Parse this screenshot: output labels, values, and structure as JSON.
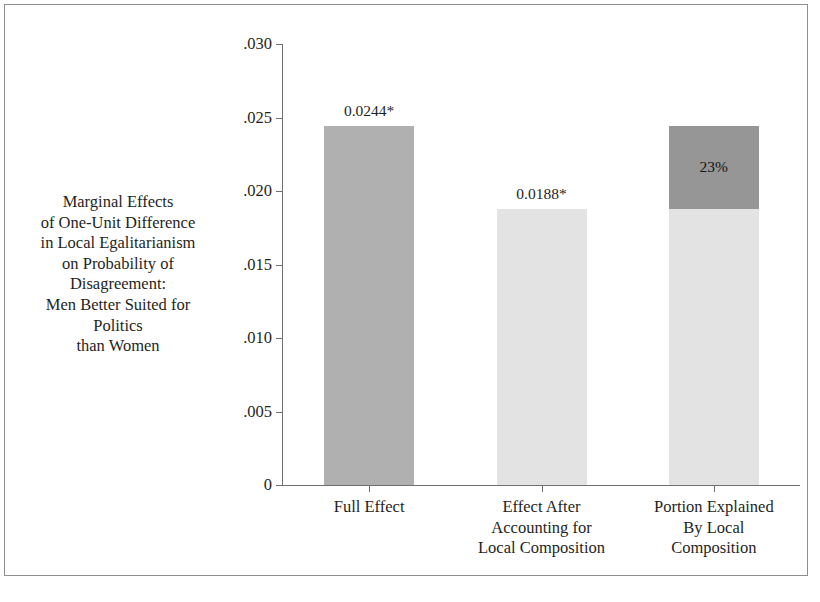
{
  "chart_data": {
    "type": "bar",
    "title": "",
    "subtitle": "",
    "xlabel": "",
    "ylabel": "Marginal Effects of One-Unit Difference in Local Egalitarianism on Probability of Disagreement: Men Better Suited for Politics than Women",
    "ylabel_lines": [
      "Marginal Effects",
      "of One-Unit Difference",
      "in Local Egalitarianism",
      "on Probability of",
      "Disagreement:",
      "Men Better Suited for",
      "Politics",
      "than Women"
    ],
    "ylim": [
      0,
      0.03
    ],
    "yticks": [
      0,
      0.005,
      0.01,
      0.015,
      0.02,
      0.025,
      0.03
    ],
    "ytick_labels": [
      "0",
      ".005",
      ".010",
      ".015",
      ".020",
      ".025",
      ".030"
    ],
    "grid": false,
    "legend": "none",
    "categories": [
      "Full Effect",
      "Effect After Accounting for Local Composition",
      "Portion Explained By Local Composition"
    ],
    "category_label_lines": [
      [
        "Full Effect"
      ],
      [
        "Effect After",
        "Accounting for",
        "Local Composition"
      ],
      [
        "Portion Explained",
        "By Local",
        "Composition"
      ]
    ],
    "values": [
      0.0244,
      0.0188,
      0.0244
    ],
    "bars": [
      {
        "category": "Full Effect",
        "value": 0.0244,
        "value_label": "0.0244*",
        "significant": true,
        "stacked": false,
        "color": "#b0b0b0",
        "segments": [
          {
            "name": "full-effect",
            "from": 0,
            "to": 0.0244,
            "color": "#b0b0b0",
            "label": ""
          }
        ]
      },
      {
        "category": "Effect After Accounting for Local Composition",
        "value": 0.0188,
        "value_label": "0.0188*",
        "significant": true,
        "stacked": false,
        "color": "#e3e3e3",
        "segments": [
          {
            "name": "residual-effect",
            "from": 0,
            "to": 0.0188,
            "color": "#e3e3e3",
            "label": ""
          }
        ]
      },
      {
        "category": "Portion Explained By Local Composition",
        "value": 0.0244,
        "value_label": "",
        "significant": false,
        "stacked": true,
        "color": "#969696",
        "segments": [
          {
            "name": "unexplained-portion",
            "from": 0,
            "to": 0.0188,
            "color": "#e3e3e3",
            "label": ""
          },
          {
            "name": "explained-portion",
            "from": 0.0188,
            "to": 0.0244,
            "color": "#969696",
            "label": "23%"
          }
        ]
      }
    ],
    "annotations": [
      {
        "name": "bar-1-value",
        "text": "0.0244*",
        "at_value": 0.0244
      },
      {
        "name": "bar-2-value",
        "text": "0.0188*",
        "at_value": 0.0188
      },
      {
        "name": "explained-share",
        "text": "23%",
        "at_value": 0.0216
      }
    ],
    "colors": {
      "bar_mid": "#b0b0b0",
      "bar_light": "#e3e3e3",
      "bar_dark": "#969696",
      "axis": "#6f6f6f",
      "frame": "#8e8e8e",
      "text": "#1f1f1f"
    }
  }
}
